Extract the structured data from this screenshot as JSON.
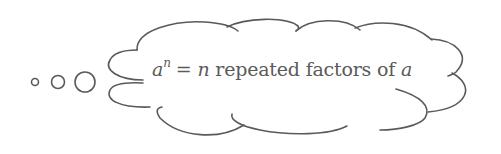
{
  "diagram": {
    "type": "thought-bubble",
    "stroke_color": "#5a5a5a",
    "text_color": "#5a5a5a",
    "background": "#ffffff",
    "bubbles": [
      {
        "cx": 35,
        "cy": 82,
        "r": 3.5
      },
      {
        "cx": 58,
        "cy": 82,
        "r": 6.5
      },
      {
        "cx": 85,
        "cy": 82,
        "r": 10
      }
    ],
    "formula": {
      "base": "a",
      "exponent": "n",
      "equals": "=",
      "count_var": "n",
      "phrase": " repeated factors of ",
      "target_var": "a"
    },
    "full_text": "a^n = n repeated factors of a"
  }
}
